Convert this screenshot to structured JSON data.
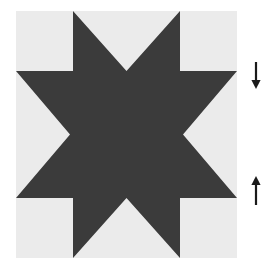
{
  "figure": {
    "title": "Eight-pointed star quilt block diagram",
    "canvas": {
      "width": 268,
      "height": 272,
      "background_color": "#ffffff"
    },
    "background_square": {
      "name": "light gray square background",
      "x": 16,
      "y": 11,
      "width": 221,
      "height": 247,
      "fill_color": "#ebebeb"
    },
    "star": {
      "name": "eight pointed star",
      "point_count": 8,
      "fill_color": "#3b3b3b",
      "center_x": 126.5,
      "center_y": 134.5,
      "description": "Dark eight-pointed LeMoyne style star filling the light gray square, with points touching the top, bottom, left and right edges of the square.",
      "polygon_points": "73,11 126.5,71 180,11 180,71 237,71 183,134.5 237,198 180,198 180,258 126.5,198 73,258 73,198 16,198 70,134.5 16,71 73,71"
    },
    "annotations": [
      {
        "name": "down-arrow",
        "type": "arrow",
        "direction": "down",
        "x": 256,
        "y_start": 62,
        "y_end": 89,
        "color": "#1a1a1a",
        "label": ""
      },
      {
        "name": "up-arrow",
        "type": "arrow",
        "direction": "up",
        "x": 256,
        "y_start": 205,
        "y_end": 176,
        "color": "#1a1a1a",
        "label": ""
      }
    ]
  }
}
